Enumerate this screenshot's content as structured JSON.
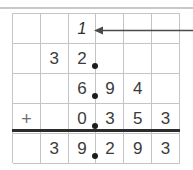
{
  "worksheet": {
    "title": "Column addition of decimals with carry",
    "operation_symbol": "+",
    "colors": {
      "grid_line": "#c4c4c4",
      "digit": "#3b3b3b",
      "rule": "#2b2b2b",
      "dot": "#1d1d1d",
      "arrow": "#4a4a4a",
      "top_rule": "#c9c9c9"
    },
    "columns": 6,
    "decimal_point_after_column": 3,
    "rows": [
      {
        "name": "carry-row",
        "kind": "carry",
        "cells": [
          "",
          "",
          "1",
          "",
          "",
          ""
        ],
        "dot": false
      },
      {
        "name": "addend-row-1",
        "kind": "addend",
        "cells": [
          "",
          "3",
          "2",
          "",
          "",
          ""
        ],
        "dot": true
      },
      {
        "name": "addend-row-2",
        "kind": "addend",
        "cells": [
          "",
          "",
          "6",
          "9",
          "4",
          ""
        ],
        "dot": true
      },
      {
        "name": "addend-row-3",
        "kind": "addend",
        "cells": [
          "+",
          "",
          "0",
          "3",
          "5",
          "3"
        ],
        "dot": true
      },
      {
        "name": "sum-row",
        "kind": "sum",
        "cells": [
          "",
          "3",
          "9",
          "2",
          "9",
          "3"
        ],
        "dot": true
      }
    ],
    "annotation": {
      "arrow_label": "carry-arrow",
      "direction": "points-left-to-carry-digit"
    }
  }
}
